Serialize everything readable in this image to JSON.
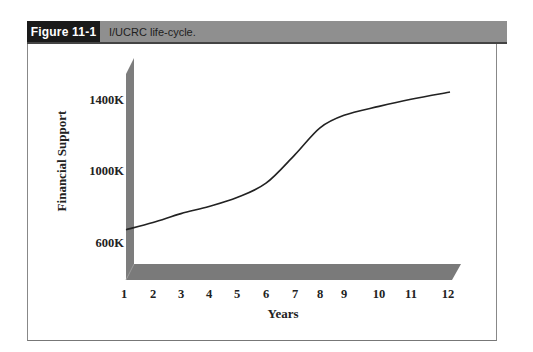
{
  "figure": {
    "label": "Figure 11-1",
    "title": "I/UCRC life-cycle."
  },
  "chart_data": {
    "type": "line",
    "title": "I/UCRC life-cycle.",
    "xlabel": "Years",
    "ylabel": "Financial Support",
    "x": [
      1,
      2,
      3,
      4,
      5,
      6,
      7,
      8,
      9,
      10,
      11,
      12
    ],
    "x_tick_labels": [
      "1",
      "2",
      "3",
      "4",
      "5",
      "6",
      "7",
      "8",
      "9",
      "10",
      "11",
      "12"
    ],
    "y_tick_labels": [
      "1400K",
      "1000K",
      "600K"
    ],
    "y_ticks": [
      1400,
      1000,
      600
    ],
    "series": [
      {
        "name": "Financial Support",
        "values": [
          680,
          720,
          770,
          810,
          860,
          940,
          1100,
          1250,
          1320,
          1370,
          1410,
          1450
        ]
      }
    ],
    "units": "K",
    "ylim": [
      600,
      1400
    ],
    "grid": false,
    "legend": "none",
    "style": "3D axis walls (gray)"
  }
}
